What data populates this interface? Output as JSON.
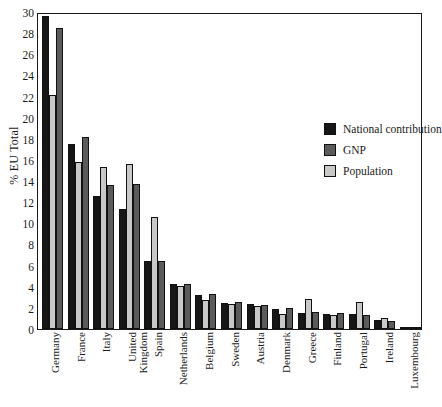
{
  "chart_data": {
    "type": "bar",
    "title": "",
    "subtitle": "",
    "xlabel": "",
    "ylabel": "% EU Total",
    "ylim": [
      0,
      30
    ],
    "yticks": [
      30,
      28,
      26,
      24,
      22,
      20,
      18,
      16,
      14,
      12,
      10,
      8,
      6,
      4,
      2,
      0
    ],
    "grid": false,
    "legend_position": "inside-top-right",
    "bar_draw_order": [
      "National contribution",
      "Population",
      "GNP"
    ],
    "categories": [
      "Germany",
      "France",
      "Italy",
      "United Kingdom",
      "Spain",
      "Netherlands",
      "Belgium",
      "Sweden",
      "Austria",
      "Denmark",
      "Greece",
      "Finland",
      "Portugal",
      "Ireland",
      "Luxembourg"
    ],
    "series": [
      {
        "name": "National contribution",
        "color": "#161616",
        "values": [
          29.6,
          17.5,
          12.6,
          11.4,
          6.4,
          4.3,
          3.2,
          2.5,
          2.4,
          1.9,
          1.5,
          1.4,
          1.4,
          0.9,
          0.2
        ]
      },
      {
        "name": "GNP",
        "color": "#5b5b5b",
        "values": [
          28.5,
          18.2,
          13.6,
          13.7,
          6.4,
          4.3,
          3.3,
          2.6,
          2.3,
          2.0,
          1.6,
          1.5,
          1.3,
          0.8,
          0.2
        ]
      },
      {
        "name": "Population",
        "color": "#c8c8c6",
        "values": [
          22.1,
          15.8,
          15.3,
          15.6,
          10.6,
          4.1,
          2.7,
          2.4,
          2.2,
          1.4,
          2.8,
          1.3,
          2.6,
          1.0,
          0.1
        ]
      }
    ]
  },
  "legend": {
    "items": [
      {
        "label": "National contribution",
        "swatch": "nat"
      },
      {
        "label": "GNP",
        "swatch": "gnp"
      },
      {
        "label": "Population",
        "swatch": "pop"
      }
    ]
  }
}
